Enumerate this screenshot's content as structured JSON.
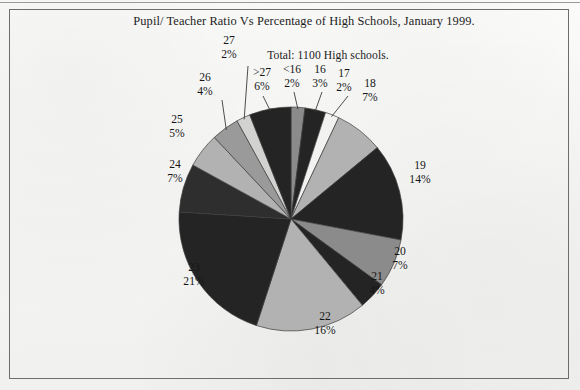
{
  "chart_title": "Pupil/ Teacher Ratio Vs Percentage of High Schools, January 1999.",
  "chart_subtitle": "Total: 1100 High schools.",
  "colors": {
    "background": "#f4f4f2",
    "border": "#6d6d6d",
    "text": "#161616",
    "dark_slice": "#242424",
    "light_slice": "#b2b2b2",
    "mid_slice": "#8b8b8b",
    "pale_slice": "#f2f2f0",
    "leader_line": "#3a3a3a"
  },
  "chart_data": {
    "type": "pie",
    "title": "Pupil/ Teacher Ratio Vs Percentage of High Schools, January 1999.",
    "subtitle": "Total: 1100 High schools.",
    "total_label": "Total: 1100 High schools.",
    "total_value": 1100,
    "xlabel": "Pupil/ Teacher Ratio",
    "ylabel": "Percentage of High Schools",
    "legend": "none",
    "start_angle_deg": 0,
    "direction": "clockwise",
    "categories": [
      "<16",
      "16",
      "17",
      "18",
      "19",
      "20",
      "21",
      "22",
      "23",
      "24",
      "25",
      "26",
      "27",
      ">27"
    ],
    "values": [
      2,
      3,
      2,
      7,
      14,
      7,
      4,
      16,
      21,
      7,
      5,
      4,
      2,
      6
    ],
    "unit": "%",
    "slices": [
      {
        "category": "<16",
        "percent": 2,
        "label": "<16",
        "pct_label": "2%",
        "fill": "#8b8b8b",
        "leader": true
      },
      {
        "category": "16",
        "percent": 3,
        "label": "16",
        "pct_label": "3%",
        "fill": "#242424",
        "leader": true
      },
      {
        "category": "17",
        "percent": 2,
        "label": "17",
        "pct_label": "2%",
        "fill": "#f2f2f0",
        "leader": true
      },
      {
        "category": "18",
        "percent": 7,
        "label": "18",
        "pct_label": "7%",
        "fill": "#b2b2b2",
        "leader": false
      },
      {
        "category": "19",
        "percent": 14,
        "label": "19",
        "pct_label": "14%",
        "fill": "#242424",
        "leader": false
      },
      {
        "category": "20",
        "percent": 7,
        "label": "20",
        "pct_label": "7%",
        "fill": "#8b8b8b",
        "leader": false
      },
      {
        "category": "21",
        "percent": 4,
        "label": "21",
        "pct_label": "4%",
        "fill": "#242424",
        "leader": false
      },
      {
        "category": "22",
        "percent": 16,
        "label": "22",
        "pct_label": "16%",
        "fill": "#b2b2b2",
        "leader": false
      },
      {
        "category": "23",
        "percent": 21,
        "label": "23",
        "pct_label": "21%",
        "fill": "#242424",
        "leader": false
      },
      {
        "category": "24",
        "percent": 7,
        "label": "24",
        "pct_label": "7%",
        "fill": "#2e2e2e",
        "leader": false
      },
      {
        "category": "25",
        "percent": 5,
        "label": "25",
        "pct_label": "5%",
        "fill": "#b2b2b2",
        "leader": false
      },
      {
        "category": "26",
        "percent": 4,
        "label": "26",
        "pct_label": "4%",
        "fill": "#9a9a9a",
        "leader": true
      },
      {
        "category": "27",
        "percent": 2,
        "label": "27",
        "pct_label": "2%",
        "fill": "#d2d2d0",
        "leader": true
      },
      {
        "category": ">27",
        "percent": 6,
        "label": ">27",
        "pct_label": "6%",
        "fill": "#242424",
        "leader": true
      }
    ]
  }
}
